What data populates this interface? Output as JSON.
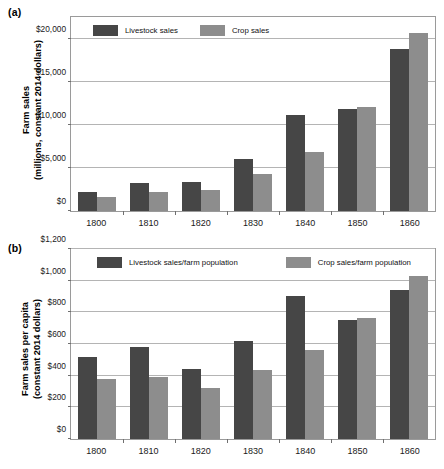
{
  "figure": {
    "panels": [
      {
        "id": "a",
        "label": "(a)",
        "ylabel_line1": "Farm sales",
        "ylabel_line2": "(millions, constant 2014 dollars)"
      },
      {
        "id": "b",
        "label": "(b)",
        "ylabel_line1": "Farm sales per capita",
        "ylabel_line2": "(constant 2014 dollars)"
      }
    ]
  },
  "chart_data": [
    {
      "type": "bar",
      "panel": "(a)",
      "title": "",
      "xlabel": "",
      "ylabel": "Farm sales (millions, constant 2014 dollars)",
      "categories": [
        "1800",
        "1810",
        "1820",
        "1830",
        "1840",
        "1850",
        "1860"
      ],
      "series": [
        {
          "name": "Livestock sales",
          "color": "#464646",
          "values": [
            2200,
            3300,
            3350,
            6050,
            11100,
            11800,
            18800
          ]
        },
        {
          "name": "Crop sales",
          "color": "#8d8d8d",
          "values": [
            1600,
            2250,
            2400,
            4250,
            6900,
            12100,
            20700
          ]
        }
      ],
      "ylim": [
        0,
        22500
      ],
      "yticks": [
        0,
        5000,
        10000,
        15000,
        20000
      ],
      "ytick_labels": [
        "$0",
        "$5,000",
        "$10,000",
        "$15,000",
        "$20,000"
      ],
      "grid": true,
      "legend_position": "inside top-left"
    },
    {
      "type": "bar",
      "panel": "(b)",
      "title": "",
      "xlabel": "",
      "ylabel": "Farm sales per capita (constant 2014 dollars)",
      "categories": [
        "1800",
        "1810",
        "1820",
        "1830",
        "1840",
        "1850",
        "1860"
      ],
      "series": [
        {
          "name": "Livestock sales/farm population",
          "color": "#464646",
          "values": [
            520,
            580,
            440,
            620,
            905,
            750,
            940
          ]
        },
        {
          "name": "Crop sales/farm population",
          "color": "#8d8d8d",
          "values": [
            380,
            390,
            320,
            435,
            565,
            765,
            1030
          ]
        }
      ],
      "ylim": [
        0,
        1200
      ],
      "yticks": [
        0,
        200,
        400,
        600,
        800,
        1000,
        1200
      ],
      "ytick_labels": [
        "$0",
        "$200",
        "$400",
        "$600",
        "$800",
        "$1,000",
        "$1,200"
      ],
      "grid": true,
      "legend_position": "inside top-left"
    }
  ]
}
